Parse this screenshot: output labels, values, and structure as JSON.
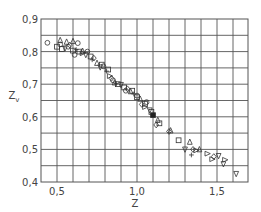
{
  "chart_data": {
    "type": "scatter",
    "title": "",
    "xlabel": "Z",
    "ylabel": "Z",
    "ylabel_subscript": "v",
    "xlim": [
      0.4,
      1.69
    ],
    "ylim": [
      0.4,
      0.9
    ],
    "x_ticks": [
      {
        "value": 0.5,
        "label": "0,5"
      },
      {
        "value": 1.0,
        "label": "1,0"
      },
      {
        "value": 1.5,
        "label": "1,5"
      }
    ],
    "y_ticks": [
      {
        "value": 0.4,
        "label": "0,4"
      },
      {
        "value": 0.5,
        "label": "0,5"
      },
      {
        "value": 0.6,
        "label": "0,6"
      },
      {
        "value": 0.7,
        "label": "0,7"
      },
      {
        "value": 0.8,
        "label": "0,8"
      },
      {
        "value": 0.9,
        "label": "0,9"
      }
    ],
    "grid": {
      "on": true,
      "x_step": 0.1,
      "y_step": 0.05
    },
    "legend": null,
    "series": [
      {
        "name": "circle",
        "marker": "circle",
        "points": [
          [
            0.44,
            0.827
          ],
          [
            0.52,
            0.822
          ],
          [
            0.57,
            0.815
          ],
          [
            0.63,
            0.826
          ],
          [
            0.69,
            0.8
          ],
          [
            0.61,
            0.79
          ],
          [
            0.79,
            0.755
          ],
          [
            0.85,
            0.712
          ],
          [
            0.93,
            0.68
          ],
          [
            1.0,
            0.665
          ],
          [
            1.06,
            0.645
          ]
        ]
      },
      {
        "name": "square",
        "marker": "square",
        "points": [
          [
            0.5,
            0.815
          ],
          [
            0.53,
            0.808
          ],
          [
            0.6,
            0.803
          ],
          [
            0.64,
            0.8
          ],
          [
            0.71,
            0.785
          ],
          [
            0.78,
            0.76
          ],
          [
            0.82,
            0.745
          ],
          [
            0.88,
            0.7
          ],
          [
            0.92,
            0.69
          ],
          [
            0.97,
            0.68
          ],
          [
            1.0,
            0.66
          ],
          [
            1.05,
            0.64
          ],
          [
            1.09,
            0.615
          ],
          [
            1.14,
            0.58
          ],
          [
            1.26,
            0.528
          ]
        ]
      },
      {
        "name": "triangle-up",
        "marker": "triangle-up",
        "points": [
          [
            0.52,
            0.835
          ],
          [
            0.56,
            0.83
          ],
          [
            0.6,
            0.832
          ],
          [
            0.66,
            0.802
          ],
          [
            0.75,
            0.765
          ],
          [
            0.86,
            0.705
          ],
          [
            0.96,
            0.678
          ],
          [
            1.02,
            0.655
          ],
          [
            1.13,
            0.59
          ],
          [
            1.21,
            0.558
          ],
          [
            1.33,
            0.523
          ],
          [
            1.39,
            0.5
          ]
        ]
      },
      {
        "name": "triangle-down",
        "marker": "triangle-down",
        "points": [
          [
            0.55,
            0.81
          ],
          [
            0.68,
            0.79
          ],
          [
            0.77,
            0.752
          ],
          [
            0.9,
            0.698
          ],
          [
            1.08,
            0.62
          ],
          [
            1.3,
            0.5
          ],
          [
            1.51,
            0.48
          ],
          [
            1.54,
            0.455
          ],
          [
            1.62,
            0.425
          ]
        ]
      },
      {
        "name": "triangle-right",
        "marker": "triangle-right",
        "points": [
          [
            0.66,
            0.795
          ],
          [
            0.83,
            0.725
          ],
          [
            1.05,
            0.63
          ],
          [
            1.37,
            0.497
          ],
          [
            1.44,
            0.487
          ],
          [
            1.47,
            0.47
          ],
          [
            1.55,
            0.468
          ]
        ]
      },
      {
        "name": "diamond",
        "marker": "diamond",
        "points": [
          [
            0.58,
            0.82
          ],
          [
            0.73,
            0.78
          ],
          [
            0.84,
            0.718
          ],
          [
            0.94,
            0.686
          ],
          [
            1.03,
            0.638
          ],
          [
            1.12,
            0.575
          ],
          [
            1.2,
            0.555
          ],
          [
            1.35,
            0.5
          ],
          [
            1.48,
            0.478
          ]
        ]
      },
      {
        "name": "plus",
        "marker": "plus",
        "points": [
          [
            0.62,
            0.806
          ],
          [
            0.72,
            0.775
          ],
          [
            0.81,
            0.74
          ],
          [
            0.87,
            0.702
          ],
          [
            0.98,
            0.67
          ],
          [
            1.34,
            0.483
          ]
        ]
      },
      {
        "name": "filled-square",
        "marker": "filled-square",
        "points": [
          [
            1.1,
            0.605
          ]
        ]
      }
    ]
  },
  "axes": {
    "x_label": "Z",
    "y_label": "Z",
    "y_label_sub": "v"
  }
}
